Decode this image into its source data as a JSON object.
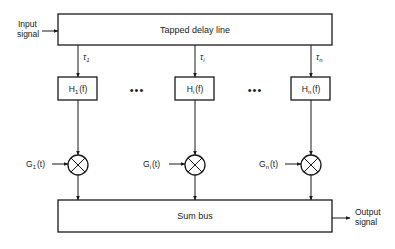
{
  "diagram": {
    "input_label_line1": "Input",
    "input_label_line2": "signal",
    "delay_line_label": "Tapped delay line",
    "taps": [
      {
        "tau_symbol": "τ",
        "tau_sub": "1",
        "filter_main": "H",
        "filter_sub": "1",
        "filter_arg": "(f)",
        "gain_main": "G",
        "gain_sub": "1",
        "gain_arg": "(t)"
      },
      {
        "tau_symbol": "τ",
        "tau_sub": "i",
        "filter_main": "H",
        "filter_sub": "i",
        "filter_arg": "(f)",
        "gain_main": "G",
        "gain_sub": "i",
        "gain_arg": "(t)"
      },
      {
        "tau_symbol": "τ",
        "tau_sub": "n",
        "filter_main": "H",
        "filter_sub": "n",
        "filter_arg": "(f)",
        "gain_main": "G",
        "gain_sub": "n",
        "gain_arg": "(t)"
      }
    ],
    "ellipsis": "•••",
    "sum_bus_label": "Sum bus",
    "output_label_line1": "Output",
    "output_label_line2": "signal"
  }
}
